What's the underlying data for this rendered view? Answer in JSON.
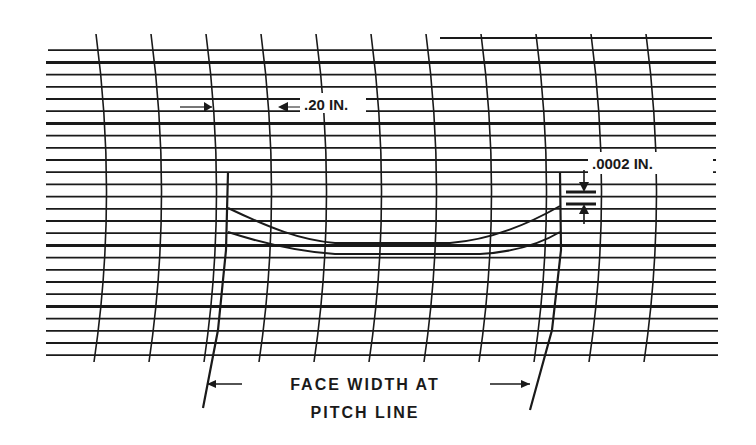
{
  "diagram": {
    "labels": {
      "spacing": ".20 IN.",
      "deviation": ".0002 IN.",
      "face_width_line1": "FACE WIDTH AT",
      "face_width_line2": "PITCH LINE"
    },
    "colors": {
      "ink": "#1a1a1a",
      "paper": "#ffffff"
    },
    "grid": {
      "horizontal_line_count": 27,
      "vertical_line_count": 11,
      "horizontal_spacing_px": 12.2,
      "vertical_spacing_px": 55
    }
  }
}
